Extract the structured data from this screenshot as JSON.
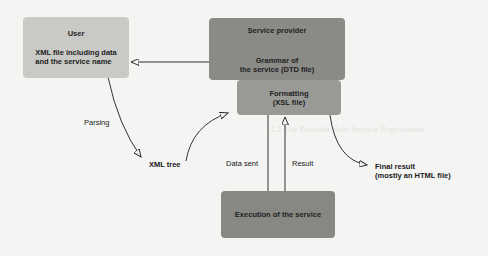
{
  "diagram": {
    "nodes": {
      "user": {
        "title": "User",
        "body_line1": "XML file including data",
        "body_line2": "and the service name"
      },
      "service_provider": {
        "title": "Service provider",
        "body_line1": "Grammar of",
        "body_line2": "the service (DTD file)"
      },
      "formatting": {
        "line1": "Formatting",
        "line2": "(XSL file)"
      },
      "execution": {
        "title": "Execution of the service"
      },
      "xml_tree": {
        "label": "XML tree"
      },
      "final_result": {
        "line1": "Final result",
        "line2": "(mostly an HTML file)"
      }
    },
    "edge_labels": {
      "parsing": "Parsing",
      "data_sent": "Data sent",
      "result": "Result"
    },
    "colors": {
      "user_box": "#c9c9c6",
      "provider_box": "#8a8a87",
      "formatting_box": "#999996",
      "execution_box": "#878784",
      "arrow": "#333333"
    }
  },
  "background_text": {
    "heading": "2.2  The Provider Side Service Registration"
  }
}
